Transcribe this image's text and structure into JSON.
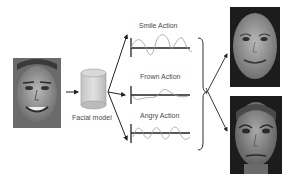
{
  "diagram": {
    "input_face": {
      "description": "photo of real person smiling",
      "icon": "face-photo"
    },
    "model": {
      "label": "Facial model",
      "icon": "cylinder-database"
    },
    "actions": [
      {
        "label": "Smile Action",
        "wave": "sine-like curve"
      },
      {
        "label": "Frown Action",
        "wave": "shallow dip curve"
      },
      {
        "label": "Angry Action",
        "wave": "regular sine wave"
      }
    ],
    "outputs": [
      {
        "description": "synthetic female face, smiling",
        "icon": "face-render"
      },
      {
        "description": "synthetic male face, angry/surprised",
        "icon": "face-render"
      }
    ],
    "colors": {
      "line": "#333333",
      "wave": "#9a9a9a",
      "cylinder": "#d0d0d0",
      "photo_bg": "#5a5a5a",
      "render_bg": "#1a1a1a"
    }
  }
}
